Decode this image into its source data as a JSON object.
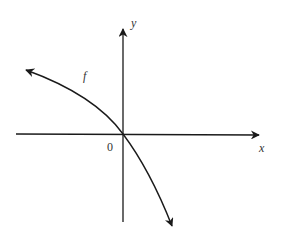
{
  "diagram": {
    "type": "function-graph",
    "axes": {
      "x_label": "x",
      "y_label": "y",
      "origin_label": "0"
    },
    "curve": {
      "label": "f",
      "description": "decreasing concave-down curve passing through the origin, arrows at both ends"
    },
    "colors": {
      "line": "#1a1a1a",
      "background": "#ffffff"
    }
  }
}
